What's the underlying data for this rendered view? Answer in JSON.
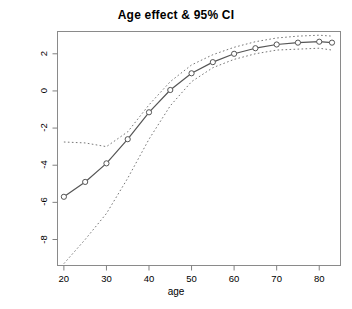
{
  "chart_data": {
    "type": "line",
    "title": "Age effect & 95% CI",
    "xlabel": "age",
    "ylabel": "",
    "xlim": [
      18.5,
      85
    ],
    "ylim": [
      -9.4,
      3.2
    ],
    "grid": false,
    "legend": null,
    "x_ticks": [
      20,
      30,
      40,
      50,
      60,
      70,
      80
    ],
    "y_ticks": [
      2,
      0,
      -2,
      -4,
      -6,
      -8
    ],
    "x": [
      20,
      25,
      30,
      35,
      40,
      45,
      50,
      55,
      60,
      65,
      70,
      75,
      80,
      83
    ],
    "series": [
      {
        "name": "Age effect",
        "style": "solid-with-open-circle-markers",
        "values": [
          -5.7,
          -4.9,
          -3.9,
          -2.6,
          -1.15,
          0.05,
          0.95,
          1.55,
          2.0,
          2.3,
          2.5,
          2.6,
          2.65,
          2.6
        ]
      },
      {
        "name": "Upper 95% CI",
        "style": "dotted",
        "values": [
          -2.75,
          -2.8,
          -3.0,
          -2.2,
          -0.75,
          0.5,
          1.4,
          1.95,
          2.35,
          2.65,
          2.85,
          2.95,
          3.0,
          2.95
        ]
      },
      {
        "name": "Lower 95% CI",
        "style": "dotted",
        "values": [
          -9.3,
          -8.0,
          -6.6,
          -4.7,
          -2.6,
          -0.8,
          0.5,
          1.25,
          1.7,
          2.0,
          2.2,
          2.25,
          2.3,
          2.2
        ]
      }
    ],
    "colors": {
      "line": "#555555",
      "ci": "#777777",
      "axis": "#808080",
      "marker_stroke": "#555555",
      "background": "#ffffff"
    }
  },
  "axis": {
    "x_tick_labels": [
      "20",
      "30",
      "40",
      "50",
      "60",
      "70",
      "80"
    ],
    "y_tick_labels": [
      "2",
      "0",
      "-2",
      "-4",
      "-6",
      "-8"
    ]
  }
}
